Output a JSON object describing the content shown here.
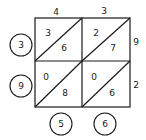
{
  "multiplicand_top": [
    "4",
    "3"
  ],
  "multiplier_right": [
    "9",
    "2"
  ],
  "cells": [
    [
      {
        "tens": "3",
        "ones": "6"
      },
      {
        "tens": "2",
        "ones": "7"
      }
    ],
    [
      {
        "tens": "0",
        "ones": "8"
      },
      {
        "tens": "0",
        "ones": "6"
      }
    ]
  ],
  "result_left": [
    "3",
    "9"
  ],
  "result_bottom": [
    "5",
    "6"
  ],
  "colors": {
    "line": "#1a1a1a",
    "background": "#ffffff"
  }
}
